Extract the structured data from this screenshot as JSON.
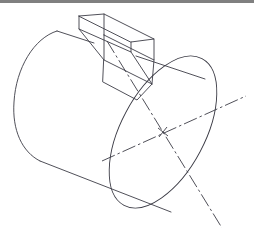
{
  "document": {
    "title": "Isometric shaft with parallel key",
    "background_color": "#ffffff",
    "border_color": "#808080",
    "line_color": "#3c3c46",
    "width": 254,
    "height": 237
  },
  "drawing": {
    "type": "isometric-engineering-drawing",
    "subject": "cylindrical shaft with rectangular parallel key seated in a keyway",
    "parts": [
      {
        "name": "shaft-body",
        "label": "Cylinder",
        "description": "Long cylindrical shaft drawn in isometric projection, axis running from upper-left to lower-right"
      },
      {
        "name": "far-end-cap",
        "label": "Far end face",
        "description": "Partial elliptical arc closing the upper-left end of the cylinder"
      },
      {
        "name": "near-end-face",
        "label": "Near end face",
        "description": "Full ellipse forming the visible circular end face of the shaft"
      },
      {
        "name": "key",
        "label": "Parallel key",
        "description": "Rectangular prism key protruding from the shaft surface"
      },
      {
        "name": "keyway",
        "label": "Keyway slot",
        "description": "Parallelogram slot cut into the shaft where the key is seated"
      }
    ],
    "annotations": [
      {
        "name": "major-axis-centerline",
        "label": "Major axis centerline",
        "style": "dash-dot",
        "description": "Dash-dot centerline running upper-left to lower-right across the near end ellipse"
      },
      {
        "name": "minor-axis-centerline",
        "label": "Minor axis centerline",
        "style": "dash-dot",
        "description": "Dash-dot centerline running lower-left to upper-right across the near end ellipse"
      },
      {
        "name": "center-mark",
        "label": "Center mark",
        "style": "cross",
        "description": "Small cross marking the centre of the near end ellipse"
      }
    ],
    "geometry": {
      "near_ellipse_center": [
        163,
        132
      ],
      "near_ellipse_rx": 42,
      "near_ellipse_ry": 83,
      "near_ellipse_rotation_deg": 28,
      "far_ellipse_center": [
        57,
        110
      ],
      "far_ellipse_rx": 42,
      "far_ellipse_ry": 83,
      "far_ellipse_rotation_deg": 28,
      "shaft_axis_angle_deg": 12
    }
  }
}
